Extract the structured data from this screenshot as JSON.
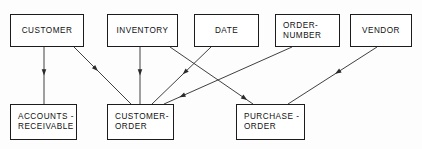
{
  "diagram": {
    "background_color": "#fdfdfd",
    "line_color": "#2a2a2a",
    "box_border_color": "#1c1c1c",
    "box_fill_color": "#ffffff",
    "nodes": [
      {
        "id": "customer",
        "label": "CUSTOMER",
        "x": 10,
        "y": 14,
        "w": 74,
        "h": 33,
        "align": "center"
      },
      {
        "id": "inventory",
        "label": "INVENTORY",
        "x": 107,
        "y": 14,
        "w": 71,
        "h": 33,
        "align": "center"
      },
      {
        "id": "date",
        "label": "DATE",
        "x": 194,
        "y": 14,
        "w": 65,
        "h": 33,
        "align": "center"
      },
      {
        "id": "order-number",
        "label": "ORDER-\nNUMBER",
        "x": 275,
        "y": 14,
        "w": 65,
        "h": 33,
        "align": "left"
      },
      {
        "id": "vendor",
        "label": "VENDOR",
        "x": 350,
        "y": 14,
        "w": 62,
        "h": 33,
        "align": "center"
      },
      {
        "id": "accounts-receivable",
        "label": "ACCOUNTS -\nRECEIVABLE",
        "x": 10,
        "y": 104,
        "w": 67,
        "h": 36,
        "align": "left"
      },
      {
        "id": "customer-order",
        "label": "CUSTOMER-\nORDER",
        "x": 107,
        "y": 104,
        "w": 67,
        "h": 36,
        "align": "left"
      },
      {
        "id": "purchase-order",
        "label": "PURCHASE -\nORDER",
        "x": 236,
        "y": 104,
        "w": 69,
        "h": 36,
        "align": "left"
      }
    ],
    "edges": [
      {
        "id": "customer-to-accounts-receivable",
        "from": "customer",
        "to": "accounts-receivable",
        "x1": 44,
        "y1": 47,
        "x2": 44,
        "y2": 104,
        "arrow_at": 0.5
      },
      {
        "id": "customer-to-customer-order",
        "from": "customer",
        "to": "customer-order",
        "x1": 74,
        "y1": 47,
        "x2": 131,
        "y2": 104,
        "arrow_at": 0.42
      },
      {
        "id": "inventory-to-customer-order",
        "from": "inventory",
        "to": "customer-order",
        "x1": 140,
        "y1": 47,
        "x2": 140,
        "y2": 104,
        "arrow_at": 0.5
      },
      {
        "id": "inventory-to-purchase-order",
        "from": "inventory",
        "to": "purchase-order",
        "x1": 170,
        "y1": 47,
        "x2": 253,
        "y2": 104,
        "arrow_at": 0.93
      },
      {
        "id": "date-to-customer-order",
        "from": "date",
        "to": "customer-order",
        "x1": 211,
        "y1": 47,
        "x2": 152,
        "y2": 104,
        "arrow_at": 0.48
      },
      {
        "id": "order-number-to-customer-order",
        "from": "order-number",
        "to": "customer-order",
        "x1": 292,
        "y1": 47,
        "x2": 164,
        "y2": 104,
        "arrow_at": 0.88
      },
      {
        "id": "vendor-to-purchase-order",
        "from": "vendor",
        "to": "purchase-order",
        "x1": 377,
        "y1": 47,
        "x2": 288,
        "y2": 104,
        "arrow_at": 0.47
      }
    ]
  }
}
